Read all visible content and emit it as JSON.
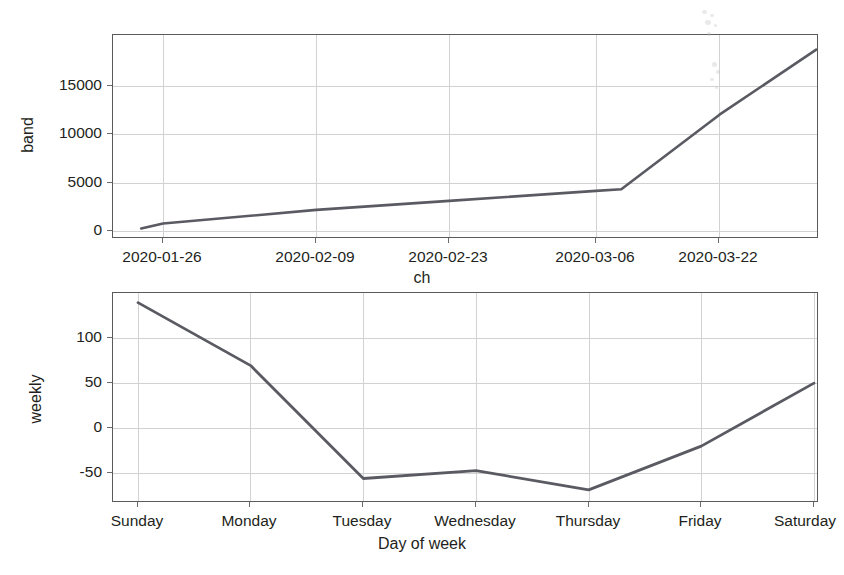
{
  "figure": {
    "background": "#ffffff",
    "line_color": "#5a5a63",
    "grid_color": "#d2d2d2",
    "axis_color": "#5a5a5a"
  },
  "chart_data": [
    {
      "id": "trend",
      "type": "line",
      "title": "",
      "xlabel": "ch",
      "ylabel": "band",
      "grid": true,
      "legend": "none",
      "xtick_labels": [
        "2020-01-26",
        "2020-02-09",
        "2020-02-23",
        "2020-03-06",
        "2020-03-22"
      ],
      "ytick_labels": [
        "0",
        "5000",
        "10000",
        "15000"
      ],
      "ytick_values": [
        0,
        5000,
        10000,
        15000
      ],
      "ylim": [
        -1500,
        19500
      ],
      "xlim": [
        0,
        100
      ],
      "xtick_positions": [
        7.1,
        28.8,
        47.6,
        68.4,
        85.9
      ],
      "series": [
        {
          "name": "trend",
          "x": [
            4.0,
            7.1,
            28.8,
            47.6,
            68.4,
            72.0,
            85.9,
            99.6
          ],
          "y": [
            -420,
            100,
            1500,
            2420,
            3450,
            3620,
            11300,
            18000
          ]
        }
      ]
    },
    {
      "id": "weekly",
      "type": "line",
      "title": "",
      "xlabel": "Day of week",
      "ylabel": "weekly",
      "grid": true,
      "legend": "none",
      "categories": [
        "Sunday",
        "Monday",
        "Tuesday",
        "Wednesday",
        "Thursday",
        "Friday",
        "Saturday"
      ],
      "xtick_labels": [
        "Sunday",
        "Monday",
        "Tuesday",
        "Wednesday",
        "Thursday",
        "Friday",
        "Saturday"
      ],
      "ytick_labels": [
        "-50",
        "0",
        "50",
        "100"
      ],
      "ytick_values": [
        -50,
        0,
        50,
        100
      ],
      "ylim": [
        -95,
        145
      ],
      "values": [
        134,
        62,
        -67,
        -58,
        -80,
        -30,
        42
      ]
    }
  ]
}
